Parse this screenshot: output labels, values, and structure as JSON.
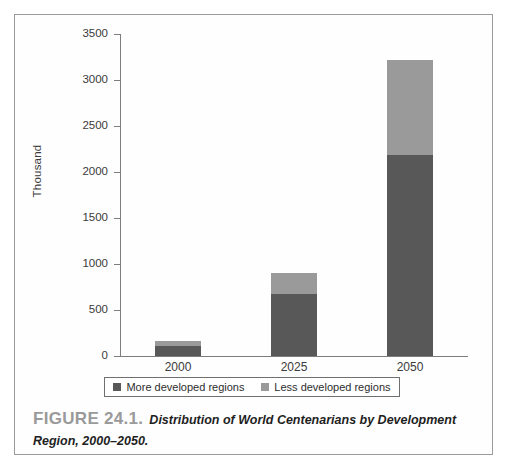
{
  "figure": {
    "label": "FIGURE 24.1.",
    "caption": "Distribution of World Centenarians by Development Region, 2000–2050."
  },
  "colors": {
    "more_developed": "#585858",
    "less_developed": "#9a9a9a",
    "axis": "#7d7d7d",
    "frame": "#9b9b9b",
    "caption_label": "#9a9a9a"
  },
  "legend": {
    "position": "bottom",
    "items": [
      {
        "label": "More developed regions",
        "color": "#585858",
        "swatch": "square-swatch"
      },
      {
        "label": "Less developed regions",
        "color": "#9a9a9a",
        "swatch": "square-swatch"
      }
    ]
  },
  "axes": {
    "y_title": "Thousand",
    "y_ticks": [
      "3500",
      "3000",
      "2500",
      "2000",
      "1500",
      "1000",
      "500",
      "0"
    ],
    "x_ticks": [
      "2000",
      "2025",
      "2050"
    ]
  },
  "chart_data": {
    "type": "bar",
    "stacked": true,
    "title": "Distribution of World Centenarians by Development Region, 2000–2050.",
    "xlabel": "",
    "ylabel": "Thousand",
    "ylim": [
      0,
      3500
    ],
    "ytick_interval": 500,
    "grid": false,
    "legend_position": "bottom",
    "categories": [
      "2000",
      "2025",
      "2050"
    ],
    "series": [
      {
        "name": "More developed regions",
        "color": "#585858",
        "values": [
          110,
          670,
          2190
        ]
      },
      {
        "name": "Less developed regions",
        "color": "#9a9a9a",
        "values": [
          55,
          230,
          1030
        ]
      }
    ],
    "totals": [
      165,
      900,
      3220
    ]
  }
}
